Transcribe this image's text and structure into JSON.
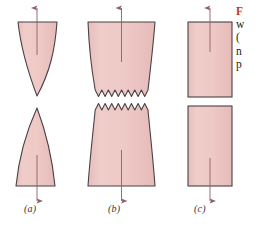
{
  "figure": {
    "background_color": "#ffffff",
    "specimen_fill": "#edc6c3",
    "specimen_fill_light": "#f2d2cf",
    "outline_color": "#4a4144",
    "arrow_color": "#8e5f6b",
    "label_color": "#3a3436",
    "caption_accent_color": "#c0392b",
    "panels": [
      {
        "id": "a",
        "label": "(a)",
        "fracture_type": "cup-and-cone",
        "top_piece": {
          "shape": "conical-point-down",
          "top_width_px": 56,
          "description": "Upper half necks to a downward point"
        },
        "bottom_piece": {
          "shape": "conical-point-up",
          "bottom_width_px": 56,
          "description": "Lower half tapers to an upward point"
        },
        "top_arrow": {
          "direction": "up",
          "label": ""
        },
        "bottom_arrow": {
          "direction": "down",
          "label": ""
        }
      },
      {
        "id": "b",
        "label": "(b)",
        "fracture_type": "cup-and-cone-jagged",
        "top_piece": {
          "shape": "necked-jagged-bottom",
          "top_width_px": 68,
          "jagged_teeth": 9,
          "description": "Upper half necks inward with jagged fracture surface"
        },
        "bottom_piece": {
          "shape": "necked-jagged-top",
          "bottom_width_px": 68,
          "jagged_teeth": 9,
          "description": "Lower half necks inward with jagged fracture surface"
        },
        "top_arrow": {
          "direction": "up",
          "label": ""
        },
        "bottom_arrow": {
          "direction": "down",
          "label": ""
        }
      },
      {
        "id": "c",
        "label": "(c)",
        "fracture_type": "brittle-flat",
        "top_piece": {
          "shape": "rectangle",
          "width_px": 44,
          "description": "Upper half with flat square fracture surface"
        },
        "bottom_piece": {
          "shape": "rectangle",
          "width_px": 44,
          "description": "Lower half with flat square fracture surface"
        },
        "top_arrow": {
          "direction": "up",
          "label": ""
        },
        "bottom_arrow": {
          "direction": "down",
          "label": ""
        }
      }
    ],
    "caption": {
      "lead": "F",
      "lines": [
        "w",
        "(",
        "n",
        "p"
      ],
      "note": "caption text clipped at right image edge"
    }
  }
}
